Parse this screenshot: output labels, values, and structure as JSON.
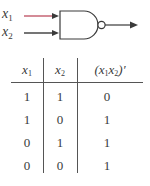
{
  "gate": {
    "type": "NAND",
    "inputs": [
      {
        "label": "x",
        "subscript": "1",
        "line_color": "#c25a6a"
      },
      {
        "label": "x",
        "subscript": "2",
        "line_color": "#3a3a3a"
      }
    ],
    "output_label": ""
  },
  "truth_table": {
    "headers": [
      {
        "base": "x",
        "sub": "1"
      },
      {
        "base": "x",
        "sub": "2"
      },
      {
        "open": "(x",
        "sub1": "1",
        "mid": "x",
        "sub2": "2",
        "close": ")′"
      }
    ],
    "rows": [
      [
        "1",
        "1",
        "0"
      ],
      [
        "1",
        "0",
        "1"
      ],
      [
        "0",
        "1",
        "1"
      ],
      [
        "0",
        "0",
        "1"
      ]
    ]
  },
  "colors": {
    "ink": "#3a3a3a",
    "accent_input1": "#c25a6a"
  }
}
